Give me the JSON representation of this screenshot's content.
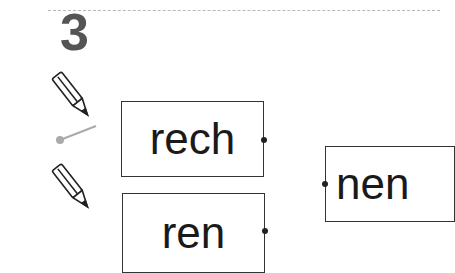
{
  "exercise": {
    "number": "3",
    "left_syllables": [
      {
        "text": "rech"
      },
      {
        "text": "ren"
      }
    ],
    "right_syllables": [
      {
        "text": "nen"
      }
    ],
    "icons": [
      "pencil-icon",
      "pencil-icon"
    ],
    "example_connector_color": "#aaaaaa"
  }
}
